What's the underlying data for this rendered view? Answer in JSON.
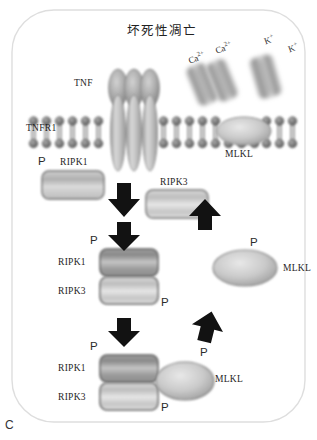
{
  "figure": {
    "panel_letter": "C",
    "title": "坏死性凋亡",
    "outline_color": "#dcdcdc",
    "background": "#ffffff"
  },
  "ligand": {
    "label": "TNF",
    "label_x": 74,
    "label_y": 84,
    "subunits": 3
  },
  "receptor": {
    "label": "TNFR1",
    "label_x": 27,
    "label_y": 124,
    "subunits": 3
  },
  "membrane": {
    "head_color": "#6e6e6e",
    "tail_color": "#5a5a5a",
    "top_y": 120,
    "bottom_y": 142
  },
  "ion_channels": [
    {
      "name": "calcium-channel-1",
      "label": "Ca2+",
      "label_x": 190,
      "label_y": 57,
      "rotate": -22
    },
    {
      "name": "calcium-channel-2",
      "label": "Ca2+",
      "label_x": 216,
      "label_y": 48,
      "rotate": -22
    },
    {
      "name": "potassium-channel-1",
      "label": "K+",
      "label_x": 265,
      "label_y": 38,
      "rotate": -18
    },
    {
      "name": "potassium-channel-2",
      "label": "K+",
      "label_x": 288,
      "label_y": 44,
      "rotate": -18
    }
  ],
  "membrane_protein": {
    "label": "MLKL",
    "label_x": 226,
    "label_y": 152
  },
  "step1": {
    "ripk1_label": "RIPK1",
    "ripk1_p": "P",
    "ripk3_label": "RIPK3",
    "mlkl_label": "MLKL"
  },
  "step2": {
    "ripk1_label": "RIPK1",
    "ripk3_label": "RIPK3",
    "p_top": "P",
    "p_bottom": "P",
    "mlkl_label": "MLKL",
    "mlkl_p": "P"
  },
  "step3": {
    "ripk1_label": "RIPK1",
    "ripk3_label": "RIPK3",
    "p_top": "P",
    "p_bottom": "P",
    "mlkl_label": "MLKL",
    "mlkl_p": "P"
  },
  "arrows": {
    "down_1": "down-arrow",
    "down_2": "down-arrow",
    "down_3": "down-arrow",
    "up_1": "up-arrow",
    "up_2": "up-arrow"
  },
  "labels": {
    "p": "P"
  }
}
